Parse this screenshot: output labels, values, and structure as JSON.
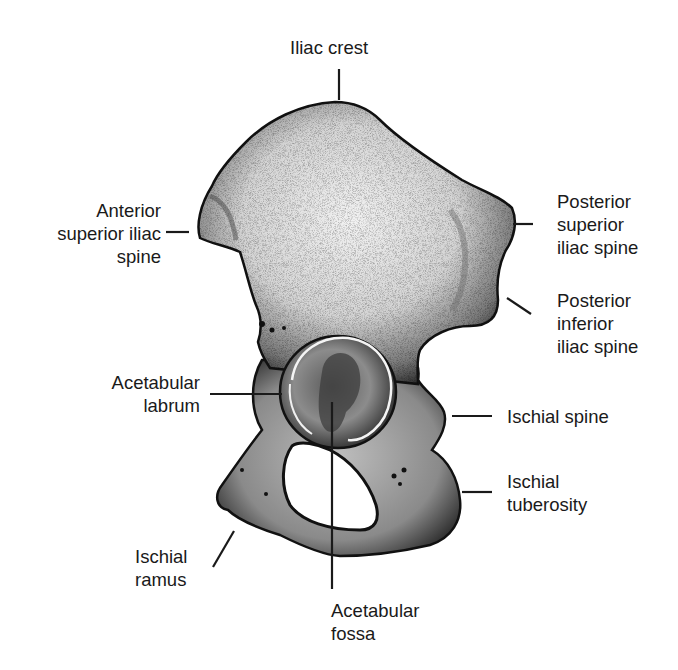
{
  "diagram": {
    "background_color": "#ffffff",
    "ink_color": "#1a1a1a",
    "labels": [
      {
        "id": "iliac-crest",
        "lines": [
          "Iliac crest"
        ]
      },
      {
        "id": "anterior-superior-iliac-spine",
        "lines": [
          "Anterior",
          "superior iliac",
          "spine"
        ]
      },
      {
        "id": "posterior-superior-iliac-spine",
        "lines": [
          "Posterior",
          "superior",
          "iliac spine"
        ]
      },
      {
        "id": "posterior-inferior-iliac-spine",
        "lines": [
          "Posterior",
          "inferior",
          "iliac spine"
        ]
      },
      {
        "id": "acetabular-labrum",
        "lines": [
          "Acetabular",
          "labrum"
        ]
      },
      {
        "id": "ischial-spine",
        "lines": [
          "Ischial spine"
        ]
      },
      {
        "id": "ischial-tuberosity",
        "lines": [
          "Ischial",
          "tuberosity"
        ]
      },
      {
        "id": "ischial-ramus",
        "lines": [
          "Ischial",
          "ramus"
        ]
      },
      {
        "id": "acetabular-fossa",
        "lines": [
          "Acetabular",
          "fossa"
        ]
      }
    ]
  }
}
